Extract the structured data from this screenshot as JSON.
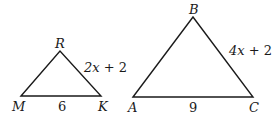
{
  "diagram": {
    "stroke_color": "#1a1a1a",
    "triangles": [
      {
        "name": "MRK",
        "vertices": {
          "M": {
            "label": "M",
            "x": 21,
            "y": 96
          },
          "R": {
            "label": "R",
            "x": 60,
            "y": 51
          },
          "K": {
            "label": "K",
            "x": 101,
            "y": 96
          }
        },
        "sides": {
          "MK": {
            "label": "6"
          },
          "RK": {
            "label_var": "2x",
            "label_rest": " + 2"
          }
        }
      },
      {
        "name": "ABC",
        "vertices": {
          "A": {
            "label": "A",
            "x": 133,
            "y": 97
          },
          "B": {
            "label": "B",
            "x": 193,
            "y": 17
          },
          "C": {
            "label": "C",
            "x": 253,
            "y": 97
          }
        },
        "sides": {
          "AC": {
            "label": "9"
          },
          "BC": {
            "label_var": "4x",
            "label_rest": " + 2"
          }
        }
      }
    ]
  }
}
